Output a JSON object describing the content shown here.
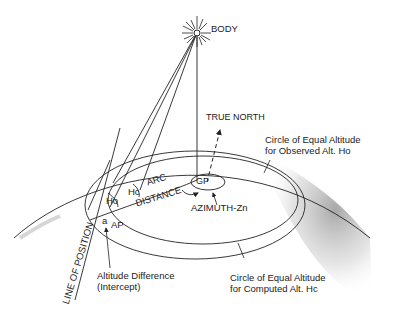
{
  "diagram": {
    "labels": {
      "body": "BODY",
      "true_north": "TRUE NORTH",
      "observed_circle_line1": "Circle of Equal Altitude",
      "observed_circle_line2": "for Observed Alt. Ho",
      "computed_circle_line1": "Circle of Equal Altitude",
      "computed_circle_line2": "for Computed Alt. Hc",
      "arc": "ARC",
      "distance": "DISTANCE",
      "gp": "GP",
      "azimuth": "AZIMUTH-Zn",
      "ho": "Ho",
      "hc": "Hc",
      "a": "a",
      "ap": "AP",
      "line_of_position": "LINE OF POSITION",
      "intercept_line1": "Altitude Difference",
      "intercept_line2": "(Intercept)"
    },
    "colors": {
      "ink": "#222222",
      "shade": "#9a9a9a",
      "background": "#ffffff"
    }
  }
}
